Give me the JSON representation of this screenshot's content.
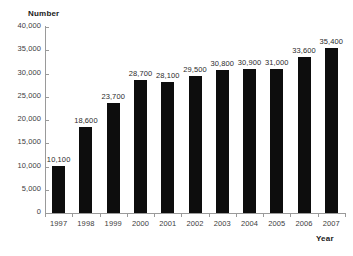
{
  "chart_data": {
    "type": "bar",
    "title": "",
    "xlabel": "Year",
    "ylabel": "Number",
    "categories": [
      "1997",
      "1998",
      "1999",
      "2000",
      "2001",
      "2002",
      "2003",
      "2004",
      "2005",
      "2006",
      "2007"
    ],
    "values": [
      10100,
      18600,
      23700,
      28700,
      28100,
      29500,
      30800,
      30900,
      31000,
      33600,
      35400
    ],
    "value_labels": [
      "10,100",
      "18,600",
      "23,700",
      "28,700",
      "28,100",
      "29,500",
      "30,800",
      "30,900",
      "31,000",
      "33,600",
      "35,400"
    ],
    "ylim": [
      0,
      40000
    ],
    "ytick_values": [
      0,
      5000,
      10000,
      15000,
      20000,
      25000,
      30000,
      35000,
      40000
    ],
    "ytick_labels": [
      "0",
      "5,000",
      "10,000",
      "15,000",
      "20,000",
      "25,000",
      "30,000",
      "35,000",
      "40,000"
    ],
    "grid": false,
    "legend": false,
    "legend_position": "none",
    "series": [
      {
        "name": "Number",
        "values": [
          10100,
          18600,
          23700,
          28700,
          28100,
          29500,
          30800,
          30900,
          31000,
          33600,
          35400
        ],
        "color": "#0d0d0d"
      }
    ],
    "colors": {
      "bar": "#0d0d0d",
      "axis": "#9a9a9a",
      "tick_label": "#3d3d3d",
      "axis_title": "#1a1a1a",
      "value_label": "#2b2b2b",
      "background": "#ffffff"
    }
  }
}
